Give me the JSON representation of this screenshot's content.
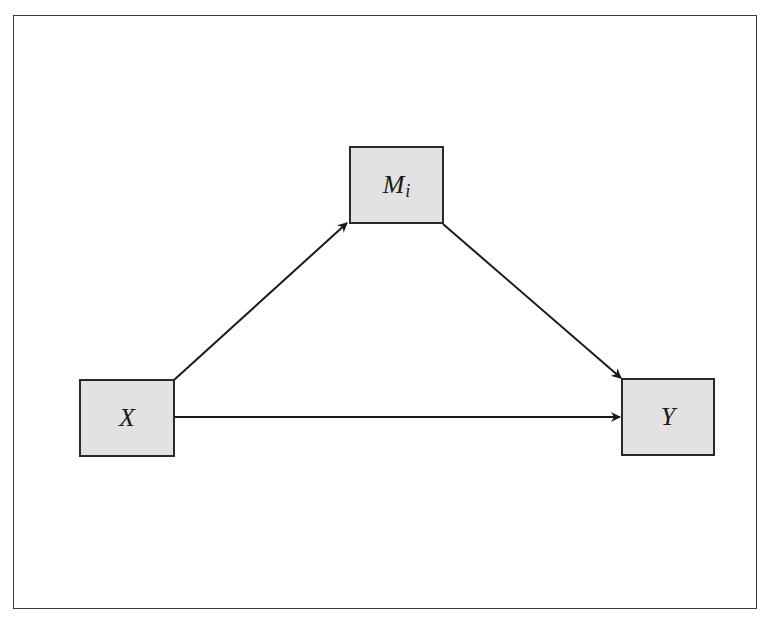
{
  "diagram": {
    "title_partial": "",
    "type": "mediation path diagram",
    "frame": {
      "border_color": "#3a3a3a",
      "background": "#ffffff"
    },
    "node_style": {
      "fill": "#e2e2e2",
      "stroke": "#2a2a2a"
    },
    "nodes": [
      {
        "id": "X",
        "label": "X",
        "subscript": "",
        "role": "independent variable"
      },
      {
        "id": "M",
        "label": "M",
        "subscript": "i",
        "role": "mediator"
      },
      {
        "id": "Y",
        "label": "Y",
        "subscript": "",
        "role": "dependent variable"
      }
    ],
    "edges": [
      {
        "from": "X",
        "to": "M",
        "style": "arrow"
      },
      {
        "from": "M",
        "to": "Y",
        "style": "arrow"
      },
      {
        "from": "X",
        "to": "Y",
        "style": "arrow"
      }
    ]
  }
}
